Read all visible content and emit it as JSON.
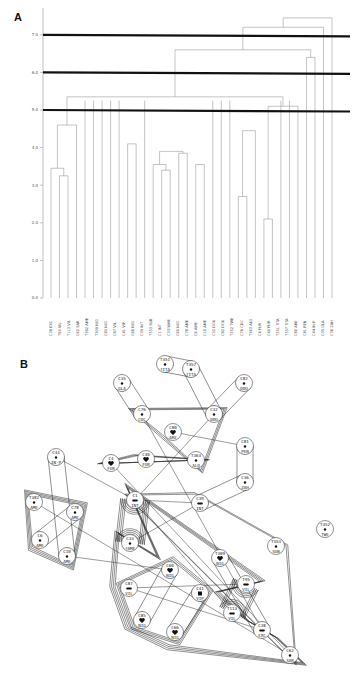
{
  "figure": {
    "panel_a_label": "A",
    "panel_b_label": "B"
  },
  "chart_data": [
    {
      "type": "dendrogram",
      "panel": "A",
      "ylabel": "",
      "yticks": [
        "0.0",
        "1.0",
        "2.0",
        "3.0",
        "4.0",
        "5.0",
        "6.0",
        "7.0"
      ],
      "ylim": [
        0,
        7.5
      ],
      "cut_lines": [
        5.0,
        6.0,
        7.0
      ],
      "leaves": [
        "C38 EXC",
        "T95 VIL",
        "T113 VIL",
        "C62 SAR",
        "T382 AME",
        "T309 NIG",
        "C85 NIG",
        "C87 VIL",
        "C41 VIP",
        "C66 NIG",
        "C39 INT",
        "T353 SUB",
        "C1 INT",
        "C33?AME",
        "C60 NIG",
        "C78 AME",
        "C6 AME",
        "C10 AME",
        "C32 DOU",
        "C82 DOU",
        "T352 TWE",
        "C76 CDC",
        "T363 ALO",
        "C4 FUR",
        "C40 FUR",
        "T351 ?ITA",
        "T357 ?ITA",
        "C80 ARE",
        "C81 PEN",
        "C44 IN-P",
        "C35 GLA",
        "C36 ZAH"
      ],
      "merges": [
        {
          "a": 1,
          "b": 2,
          "height": 3.25
        },
        {
          "a": 0,
          "b": "m0",
          "height": 3.45
        },
        {
          "a": 13,
          "b": 14,
          "height": 3.4
        },
        {
          "a": 12,
          "b": "m2",
          "height": 3.55
        },
        {
          "a": 17,
          "b": 18,
          "height": 3.55
        },
        {
          "a": 15,
          "b": 16,
          "height": 3.85
        },
        {
          "a": "m3",
          "b": "m5",
          "height": 3.9
        },
        {
          "a": 9,
          "b": 10,
          "height": 4.1
        },
        {
          "a": 25,
          "b": 26,
          "height": 2.1
        },
        {
          "a": 22,
          "b": 23,
          "height": 2.7
        },
        {
          "a": 3,
          "b": "m1",
          "height": 4.6
        },
        {
          "a": 24,
          "b": "m9",
          "height": 4.45
        },
        {
          "a": 29,
          "b": "m8",
          "height": 5.1
        },
        {
          "a": 30,
          "b": 31,
          "height": 6.4
        },
        {
          "a": "m10",
          "b": "m12",
          "height": 5.35
        },
        {
          "a": "m14",
          "b": "m13",
          "height": 6.6
        },
        {
          "a": "m15",
          "b": 32,
          "height": 7.2
        },
        {
          "a": "m16",
          "b": 33,
          "height": 7.45
        }
      ]
    }
  ],
  "network": {
    "nodes": [
      {
        "id": "T351",
        "group": "?ITA",
        "x": 165,
        "y": 364,
        "marker": "dot"
      },
      {
        "id": "T357",
        "group": "?ITA",
        "x": 191,
        "y": 369,
        "marker": "dot"
      },
      {
        "id": "C35",
        "group": "GLA",
        "x": 122,
        "y": 383,
        "marker": "dot"
      },
      {
        "id": "C82",
        "group": "DOU",
        "x": 244,
        "y": 383,
        "marker": "dot"
      },
      {
        "id": "C76",
        "group": "CDC",
        "x": 142,
        "y": 414,
        "marker": "dot"
      },
      {
        "id": "C32",
        "group": "DOU",
        "x": 214,
        "y": 414,
        "marker": "dot"
      },
      {
        "id": "C80",
        "group": "ARE",
        "x": 173,
        "y": 432,
        "marker": "heart"
      },
      {
        "id": "C81",
        "group": "PEN",
        "x": 245,
        "y": 446,
        "marker": "dot"
      },
      {
        "id": "C44",
        "group": "IN-P",
        "x": 56,
        "y": 457,
        "marker": "dot"
      },
      {
        "id": "C4",
        "group": "FUR",
        "x": 111,
        "y": 463,
        "marker": "heart"
      },
      {
        "id": "C40",
        "group": "FUR",
        "x": 146,
        "y": 459,
        "marker": "heart"
      },
      {
        "id": "T363",
        "group": "ALO",
        "x": 196,
        "y": 460,
        "marker": "dot"
      },
      {
        "id": "C36",
        "group": "ZAH",
        "x": 245,
        "y": 482,
        "marker": "dot"
      },
      {
        "id": "C1",
        "group": "INT",
        "x": 135,
        "y": 500,
        "marker": "pair"
      },
      {
        "id": "C39",
        "group": "INT",
        "x": 200,
        "y": 503,
        "marker": "pair"
      },
      {
        "id": "T382",
        "group": "AME",
        "x": 34,
        "y": 502,
        "marker": "dot"
      },
      {
        "id": "C78",
        "group": "AME",
        "x": 75,
        "y": 512,
        "marker": "dot"
      },
      {
        "id": "C6",
        "group": "AME",
        "x": 40,
        "y": 540,
        "marker": "dot"
      },
      {
        "id": "C10",
        "group": "AME",
        "x": 67,
        "y": 556,
        "marker": "dot"
      },
      {
        "id": "C33",
        "group": "?AME",
        "x": 130,
        "y": 543,
        "marker": "dot"
      },
      {
        "id": "T353",
        "group": "SUB",
        "x": 276,
        "y": 546,
        "marker": "dot"
      },
      {
        "id": "T352",
        "group": "TWE",
        "x": 325,
        "y": 529,
        "marker": "dot"
      },
      {
        "id": "T309",
        "group": "NIG",
        "x": 220,
        "y": 558,
        "marker": "heart"
      },
      {
        "id": "C60",
        "group": "NIG",
        "x": 170,
        "y": 570,
        "marker": "heart"
      },
      {
        "id": "C87",
        "group": "VIL",
        "x": 129,
        "y": 588,
        "marker": "pair"
      },
      {
        "id": "C41",
        "group": "VIP",
        "x": 200,
        "y": 593,
        "marker": "square"
      },
      {
        "id": "T95",
        "group": "VIL",
        "x": 246,
        "y": 584,
        "marker": "pair"
      },
      {
        "id": "T113",
        "group": "VIL",
        "x": 232,
        "y": 613,
        "marker": "pair"
      },
      {
        "id": "C85",
        "group": "NIG",
        "x": 142,
        "y": 620,
        "marker": "heart"
      },
      {
        "id": "C66",
        "group": "NIG",
        "x": 175,
        "y": 632,
        "marker": "heart"
      },
      {
        "id": "C38",
        "group": "EXC",
        "x": 262,
        "y": 630,
        "marker": "pair"
      },
      {
        "id": "C62",
        "group": "SAR",
        "x": 290,
        "y": 655,
        "marker": "dot"
      }
    ]
  }
}
